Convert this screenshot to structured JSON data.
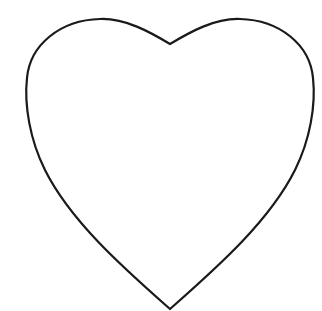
{
  "image": {
    "subject": "heart outline",
    "background_color": "#ffffff",
    "stroke_color": "#1a1a1a",
    "fill_color": "#ffffff"
  }
}
